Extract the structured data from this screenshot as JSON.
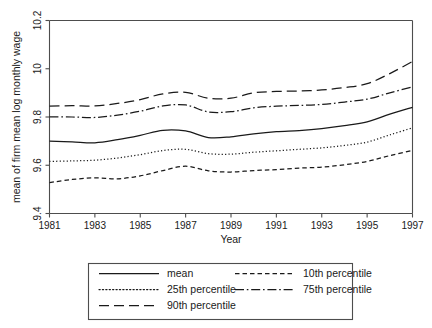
{
  "chart_data": {
    "type": "line",
    "title": "",
    "xlabel": "Year",
    "ylabel": "mean of firm mean log monthly wage",
    "xlim": [
      1981,
      1997
    ],
    "ylim": [
      9.4,
      10.2
    ],
    "xticks": [
      1981,
      1983,
      1985,
      1987,
      1989,
      1991,
      1993,
      1995,
      1997
    ],
    "xtick_labels": [
      "1981",
      "1983",
      "1985",
      "1987",
      "1989",
      "1991",
      "1993",
      "1995",
      "1997"
    ],
    "yticks": [
      9.4,
      9.6,
      9.8,
      10,
      10.2
    ],
    "ytick_labels": [
      "9.4",
      "9.6",
      "9.8",
      "10",
      "10.2"
    ],
    "grid": false,
    "legend_position": "bottom",
    "x": [
      1981,
      1982,
      1983,
      1984,
      1985,
      1986,
      1987,
      1988,
      1989,
      1990,
      1991,
      1992,
      1993,
      1994,
      1995,
      1996,
      1997
    ],
    "series": [
      {
        "name": "mean",
        "dash": "solid",
        "values": [
          9.7,
          9.697,
          9.693,
          9.706,
          9.724,
          9.745,
          9.742,
          9.715,
          9.718,
          9.73,
          9.739,
          9.744,
          9.752,
          9.764,
          9.78,
          9.812,
          9.84
        ]
      },
      {
        "name": "10th percentile",
        "dash": "short-dash",
        "values": [
          9.528,
          9.541,
          9.548,
          9.544,
          9.556,
          9.578,
          9.596,
          9.577,
          9.572,
          9.578,
          9.582,
          9.588,
          9.592,
          9.602,
          9.616,
          9.64,
          9.662
        ]
      },
      {
        "name": "25th percentile",
        "dash": "dotted",
        "values": [
          9.616,
          9.618,
          9.621,
          9.63,
          9.644,
          9.661,
          9.666,
          9.648,
          9.646,
          9.654,
          9.66,
          9.666,
          9.672,
          9.682,
          9.696,
          9.726,
          9.755
        ]
      },
      {
        "name": "75th percentile",
        "dash": "dash-dot",
        "values": [
          9.801,
          9.8,
          9.798,
          9.808,
          9.824,
          9.846,
          9.85,
          9.821,
          9.822,
          9.838,
          9.845,
          9.848,
          9.852,
          9.862,
          9.874,
          9.9,
          9.925
        ]
      },
      {
        "name": "90th percentile",
        "dash": "long-dash",
        "values": [
          9.845,
          9.847,
          9.846,
          9.856,
          9.872,
          9.896,
          9.902,
          9.878,
          9.878,
          9.9,
          9.906,
          9.908,
          9.912,
          9.922,
          9.938,
          9.98,
          10.03
        ]
      }
    ]
  },
  "legend": {
    "entries": [
      {
        "label": "mean",
        "dash": "solid"
      },
      {
        "label": "10th percentile",
        "dash": "short-dash"
      },
      {
        "label": "25th percentile",
        "dash": "dotted"
      },
      {
        "label": "75th percentile",
        "dash": "dash-dot"
      },
      {
        "label": "90th percentile",
        "dash": "long-dash"
      }
    ]
  },
  "colors": {
    "line": "#1a1a1a",
    "axis": "#4d4d4d",
    "background": "#ffffff"
  }
}
